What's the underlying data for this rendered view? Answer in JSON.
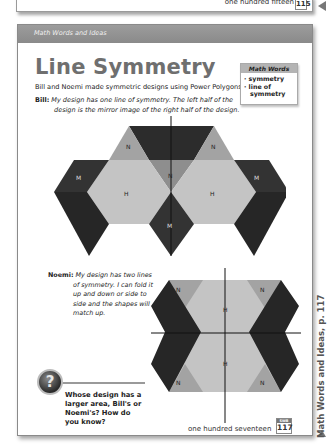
{
  "previous_page": {
    "footer_text": "one hundred fifteen",
    "page_number": "115"
  },
  "page": {
    "section_header": "Math Words and Ideas",
    "title": "Line Symmetry",
    "intro": "Bill and Noemi made symmetric designs using Power Polygons.",
    "bill": {
      "speaker": "Bill:",
      "text": "My design has one line of symmetry. The left half of the design is the mirror image of the right half of the design."
    },
    "noemi": {
      "speaker": "Noemi:",
      "text": "My design has two lines of symmetry. I can fold it up and down or side to side and the shapes will match up."
    },
    "math_words": {
      "heading": "Math Words",
      "items": [
        "symmetry",
        "line of symmetry"
      ]
    },
    "question": {
      "icon": "question-mark-icon",
      "text": "Whose design has a larger area, Bill's or Noemi's? How do you know?"
    },
    "footer": {
      "text": "one hundred seventeen",
      "badge_label": "SWB",
      "page_number": "117"
    },
    "side_label": "Math Words and Ideas, p. 117",
    "designs": {
      "bill_design": {
        "lines_of_symmetry": 1,
        "shape_labels": [
          "N",
          "N",
          "N",
          "M",
          "M",
          "H",
          "H",
          "M"
        ]
      },
      "noemi_design": {
        "lines_of_symmetry": 2,
        "shape_labels": [
          "N",
          "N",
          "H",
          "H",
          "N",
          "N"
        ]
      }
    },
    "colors": {
      "dark_shape": "#2c2c2c",
      "mid_shape": "#9a9a9a",
      "light_shape": "#c4c4c4",
      "header_bar": "#939393"
    }
  }
}
